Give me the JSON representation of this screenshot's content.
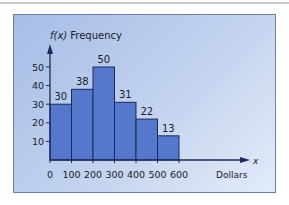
{
  "chart_data": {
    "type": "bar",
    "title": "",
    "xlabel": "Dollars",
    "ylabel": "f(x) Frequency",
    "x_axis_symbol": "x",
    "categories": [
      "0-100",
      "100-200",
      "200-300",
      "300-400",
      "400-500",
      "500-600"
    ],
    "bin_edges": [
      0,
      100,
      200,
      300,
      400,
      500,
      600
    ],
    "values": [
      30,
      38,
      50,
      31,
      22,
      13
    ],
    "x_tick_labels": [
      "0",
      "100",
      "200",
      "300",
      "400",
      "500",
      "600"
    ],
    "y_tick_labels": [
      "10",
      "20",
      "30",
      "40",
      "50"
    ],
    "y_ticks": [
      10,
      20,
      30,
      40,
      50
    ],
    "ylim": [
      0,
      55
    ],
    "xlim": [
      0,
      600
    ],
    "grid": false,
    "legend": null,
    "data_labels": [
      "30",
      "38",
      "50",
      "31",
      "22",
      "13"
    ],
    "bar_color": "#5577cc",
    "bar_edge_color": "#1e2a5a"
  },
  "labels": {
    "y_axis_fx": "f(x)",
    "y_axis_word": "Frequency",
    "x_axis_var": "x",
    "x_axis_unit": "Dollars"
  }
}
